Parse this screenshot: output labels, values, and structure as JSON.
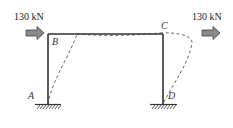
{
  "diagram": {
    "type": "portal-frame",
    "loads": [
      {
        "id": "left",
        "label": "130 kN",
        "direction": "right",
        "applied_at": "B"
      },
      {
        "id": "right",
        "label": "130 kN",
        "direction": "right",
        "applied_at": "C"
      }
    ],
    "nodes": [
      {
        "id": "A",
        "label": "A",
        "support": "fixed"
      },
      {
        "id": "B",
        "label": "B"
      },
      {
        "id": "C",
        "label": "C"
      },
      {
        "id": "D",
        "label": "D",
        "support": "fixed"
      }
    ],
    "members": [
      {
        "from": "A",
        "to": "B",
        "type": "column"
      },
      {
        "from": "B",
        "to": "C",
        "type": "beam"
      },
      {
        "from": "C",
        "to": "D",
        "type": "column"
      }
    ],
    "deflected_shape": {
      "style": "dashed",
      "sway": "right"
    },
    "colors": {
      "frame": "#333333",
      "dashed": "#666666",
      "arrow_fill": "#8a8a8a",
      "arrow_stroke": "#444444",
      "text": "#222222"
    }
  }
}
